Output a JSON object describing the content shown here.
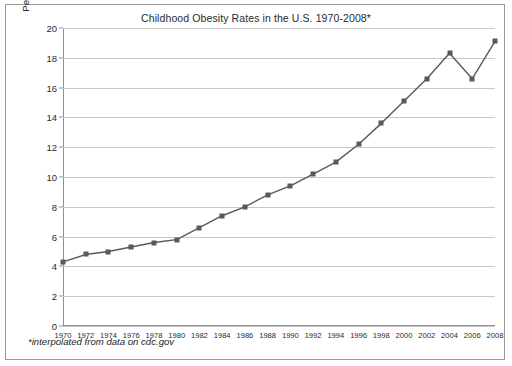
{
  "chart_data": {
    "type": "line",
    "title": "Childhood Obesity Rates in the U.S. 1970-2008*",
    "xlabel": "",
    "ylabel": "Percentage of children ages 6-19",
    "footnote": "*interpolated from data on cdc.gov",
    "grid": true,
    "legend": "none",
    "xlim": [
      1970,
      2008
    ],
    "ylim": [
      0,
      20
    ],
    "ytick_values": [
      20,
      18,
      16,
      14,
      12,
      10,
      8,
      6,
      4,
      2,
      0
    ],
    "ytick_labels": [
      "20",
      "18",
      "16",
      "14",
      "12",
      "10",
      "8",
      "6",
      "4",
      "2",
      "0"
    ],
    "categories": [
      1970,
      1972,
      1974,
      1976,
      1978,
      1980,
      1982,
      1984,
      1986,
      1988,
      1990,
      1992,
      1994,
      1996,
      1998,
      2000,
      2002,
      2004,
      2006,
      2008
    ],
    "xtick_labels": [
      "1970",
      "1972",
      "1974",
      "1976",
      "1978",
      "1980",
      "1982",
      "1984",
      "1986",
      "1988",
      "1990",
      "1992",
      "1994",
      "1996",
      "1998",
      "2000",
      "2002",
      "2004",
      "2006",
      "2008"
    ],
    "values": [
      4.3,
      4.8,
      5.0,
      5.3,
      5.6,
      5.8,
      6.6,
      7.4,
      8.0,
      8.8,
      9.4,
      10.2,
      11.0,
      12.2,
      13.6,
      15.1,
      16.6,
      18.3,
      16.6,
      19.1
    ],
    "series": [
      {
        "name": "Childhood obesity rate",
        "marker": "square",
        "line_color": "#595959",
        "marker_color": "#595959",
        "values": [
          4.3,
          4.8,
          5.0,
          5.3,
          5.6,
          5.8,
          6.6,
          7.4,
          8.0,
          8.8,
          9.4,
          10.2,
          11.0,
          12.2,
          13.6,
          15.1,
          16.6,
          18.3,
          16.6,
          19.1
        ]
      }
    ],
    "colors": {
      "line": "#595959",
      "grid": "#c9c9c9",
      "axis": "#8f8f8f",
      "text": "#2b2b2b",
      "background": "#ffffff",
      "border": "#9a9a9a"
    }
  }
}
